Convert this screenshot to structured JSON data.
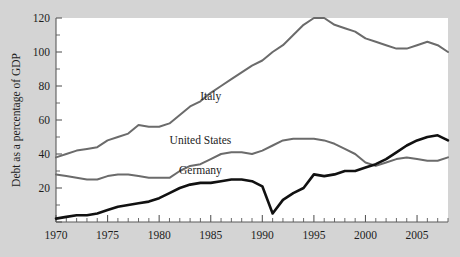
{
  "chart_data": {
    "type": "line",
    "title": "",
    "subtitle": "",
    "xlabel": "",
    "ylabel": "Debt as a percentage of GDP",
    "xlim": [
      1970,
      2008
    ],
    "ylim": [
      0,
      120
    ],
    "grid": false,
    "legend_position": "inline-annotations",
    "y_ticks_major": [
      0,
      20,
      40,
      60,
      80,
      100,
      120
    ],
    "y_ticks_major_labels": [
      "",
      "20",
      "40",
      "60",
      "80",
      "100",
      "120"
    ],
    "y_ticks_minor": [
      10,
      30,
      50,
      70,
      90,
      110
    ],
    "x_ticks_major": [
      1970,
      1975,
      1980,
      1985,
      1990,
      1995,
      2000,
      2005
    ],
    "x_ticks_major_labels": [
      "1970",
      "1975",
      "1980",
      "1985",
      "1990",
      "1995",
      "2000",
      "2005"
    ],
    "x_tick_minor_step": 1,
    "x": [
      1970,
      1971,
      1972,
      1973,
      1974,
      1975,
      1976,
      1977,
      1978,
      1979,
      1980,
      1981,
      1982,
      1983,
      1984,
      1985,
      1986,
      1987,
      1988,
      1989,
      1990,
      1991,
      1992,
      1993,
      1994,
      1995,
      1996,
      1997,
      1998,
      1999,
      2000,
      2001,
      2002,
      2003,
      2004,
      2005,
      2006,
      2007,
      2008
    ],
    "series": [
      {
        "name": "Italy",
        "color": "#6b6b6b",
        "line_width": 2.0,
        "label_x": 1985,
        "label_y": 72,
        "values": [
          38,
          40,
          42,
          43,
          44,
          48,
          50,
          52,
          57,
          56,
          56,
          58,
          63,
          68,
          71,
          76,
          80,
          84,
          88,
          92,
          95,
          100,
          104,
          110,
          116,
          120,
          120,
          116,
          114,
          112,
          108,
          106,
          104,
          102,
          102,
          104,
          106,
          104,
          100
        ]
      },
      {
        "name": "United States",
        "color": "#6b6b6b",
        "line_width": 2.0,
        "label_x": 1984,
        "label_y": 46,
        "values": [
          28,
          27,
          26,
          25,
          25,
          27,
          28,
          28,
          27,
          26,
          26,
          26,
          30,
          33,
          34,
          37,
          40,
          41,
          41,
          40,
          42,
          45,
          48,
          49,
          49,
          49,
          48,
          46,
          43,
          40,
          35,
          33,
          35,
          37,
          38,
          37,
          36,
          36,
          38
        ]
      },
      {
        "name": "Germany",
        "color": "#111111",
        "line_width": 2.6,
        "label_x": 1984,
        "label_y": 28,
        "values": [
          2,
          3,
          4,
          4,
          5,
          7,
          9,
          10,
          11,
          12,
          14,
          17,
          20,
          22,
          23,
          23,
          24,
          25,
          25,
          24,
          21,
          5,
          13,
          17,
          20,
          28,
          27,
          28,
          30,
          30,
          32,
          34,
          37,
          41,
          45,
          48,
          50,
          51,
          48
        ]
      }
    ],
    "annotations": [
      {
        "text": "Italy",
        "x": 1985,
        "y": 72
      },
      {
        "text": "United States",
        "x": 1984,
        "y": 46
      },
      {
        "text": "Germany",
        "x": 1984,
        "y": 28
      }
    ]
  },
  "figure": {
    "background_color": "#d4d4d4",
    "plot_background_color": "#ffffff",
    "axis_color": "#5a5a5a"
  }
}
